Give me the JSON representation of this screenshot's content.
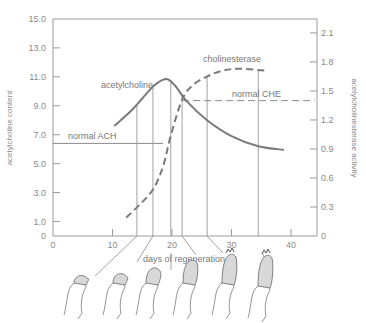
{
  "chart_data": {
    "type": "line",
    "title": "",
    "xlabel": "days of regeneration",
    "ylabel": "acetylcholine content",
    "y2label": "acetylcholinesterase activity",
    "xlim": [
      0,
      44
    ],
    "ylim": [
      0,
      15.0
    ],
    "y2lim": [
      0,
      2.2
    ],
    "x_ticks": [
      "10",
      "20",
      "30",
      "40"
    ],
    "x_tick_values": [
      10,
      20,
      30,
      40
    ],
    "x_origin_label": "0",
    "y_ticks": [
      "15.0",
      "13.0",
      "11.0",
      "9.0",
      "7.0",
      "5.0",
      "3.0",
      "1.0"
    ],
    "y_tick_values": [
      15,
      13,
      11,
      9,
      7,
      5,
      3,
      1
    ],
    "y_origin_label": "0",
    "y2_ticks": [
      "2.1",
      "1.8",
      "1.5",
      "1.2",
      "0.9",
      "0.6",
      "0.3"
    ],
    "y2_tick_values": [
      2.1,
      1.8,
      1.5,
      1.2,
      0.9,
      0.6,
      0.3
    ],
    "y2_origin_label": "0",
    "grid": false,
    "legend": null,
    "series": [
      {
        "name": "acetylcholine",
        "axis": "left",
        "style": "solid",
        "x": [
          10.3,
          13,
          15,
          17,
          19,
          20.5,
          22.5,
          25.9,
          30,
          34.5,
          38.8
        ],
        "values": [
          7.6,
          8.6,
          9.5,
          10.4,
          10.85,
          10.4,
          9.3,
          8.0,
          6.9,
          6.2,
          5.95
        ]
      },
      {
        "name": "cholinesterase",
        "axis": "right",
        "style": "dashed",
        "x": [
          12.3,
          14.5,
          16.8,
          18.5,
          19.8,
          21.7,
          23.5,
          25.9,
          28.5,
          31.4,
          35.6
        ],
        "values": [
          0.19,
          0.32,
          0.48,
          0.72,
          1.04,
          1.41,
          1.56,
          1.65,
          1.71,
          1.73,
          1.71
        ]
      }
    ],
    "reference_lines": [
      {
        "label": "normal ACH",
        "axis": "left",
        "value": 6.4,
        "x_from": 0,
        "x_to": 18.5,
        "style": "solid"
      },
      {
        "label": "normal CHE",
        "axis": "right",
        "value": 1.4,
        "x_from": 21.7,
        "x_to": 44,
        "style": "dashed"
      }
    ],
    "sample_markers_days": [
      14.1,
      16.8,
      19.8,
      21.7,
      25.9,
      34.5
    ],
    "annotations": [
      "acetylcholine",
      "cholinesterase",
      "normal ACH",
      "normal CHE",
      "days of regeneration"
    ],
    "illustrations": "six drawings of a regenerating limb stump at successive stages, each linked by a line to a day marker"
  },
  "labels": {
    "ach_curve": "acetylcholine",
    "che_curve": "cholinesterase",
    "normal_ach": "normal ACH",
    "normal_che": "normal CHE",
    "xlabel": "days of regeneration",
    "ylabel": "acetylcholine content",
    "y2label": "acetylcholinesterase activity"
  }
}
